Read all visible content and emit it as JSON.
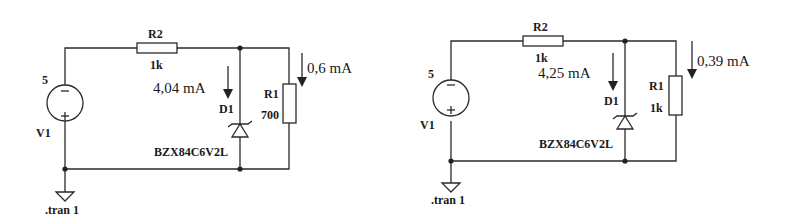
{
  "circuits": [
    {
      "name": "left",
      "source": {
        "ref": "V1",
        "value": "5"
      },
      "series_resistor": {
        "ref": "R2",
        "value": "1k"
      },
      "load_resistor": {
        "ref": "R1",
        "value": "700"
      },
      "zener": {
        "ref": "D1",
        "part": "BZX84C6V2L"
      },
      "zener_current": "4,04 mA",
      "load_current": "0,6 mA",
      "directive": ".tran 1"
    },
    {
      "name": "right",
      "source": {
        "ref": "V1",
        "value": "5"
      },
      "series_resistor": {
        "ref": "R2",
        "value": "1k"
      },
      "load_resistor": {
        "ref": "R1",
        "value": "1k"
      },
      "zener": {
        "ref": "D1",
        "part": "BZX84C6V2L"
      },
      "zener_current": "4,25 mA",
      "load_current": "0,39 mA",
      "directive": ".tran 1"
    }
  ],
  "symbols": {
    "minus": "−",
    "plus": "+"
  }
}
